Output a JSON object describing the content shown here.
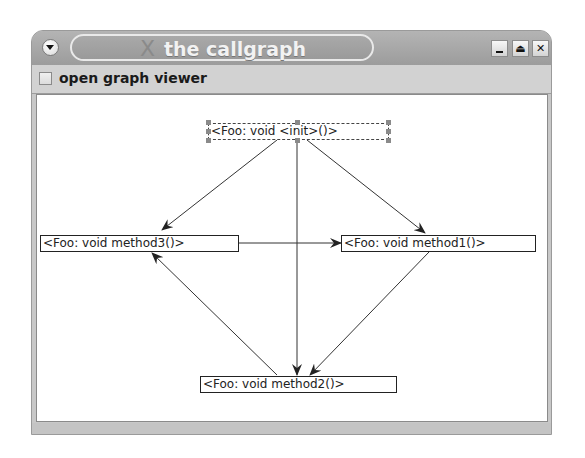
{
  "window": {
    "title": "the callgraph",
    "title_icon": "x-logo-icon",
    "controls": [
      {
        "name": "minimize",
        "icon": "minimize-icon",
        "glyph": ""
      },
      {
        "name": "maximize",
        "icon": "eject-icon",
        "glyph": "⏏"
      },
      {
        "name": "close",
        "icon": "close-icon",
        "glyph": "✕"
      }
    ]
  },
  "toolbar": {
    "checkbox_label": "open graph viewer",
    "checkbox_checked": false
  },
  "graph": {
    "nodes": [
      {
        "id": "init",
        "label": "<Foo: void <init>()>",
        "selected": true
      },
      {
        "id": "method3",
        "label": "<Foo: void method3()>",
        "selected": false
      },
      {
        "id": "method1",
        "label": "<Foo: void method1()>",
        "selected": false
      },
      {
        "id": "method2",
        "label": "<Foo: void method2()>",
        "selected": false
      }
    ],
    "edges": [
      {
        "from": "init",
        "to": "method3"
      },
      {
        "from": "init",
        "to": "method1"
      },
      {
        "from": "init",
        "to": "method2"
      },
      {
        "from": "method3",
        "to": "method1"
      },
      {
        "from": "method1",
        "to": "method2"
      },
      {
        "from": "method2",
        "to": "method3"
      }
    ]
  }
}
